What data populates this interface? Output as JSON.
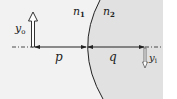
{
  "diagram": {
    "labels": {
      "n1": "n",
      "n1_sub": "1",
      "n2": "n",
      "n2_sub": "2",
      "object_height": "y",
      "object_height_sub": "o",
      "image_height": "y",
      "image_height_sub": "i",
      "object_distance": "p",
      "image_distance": "q"
    },
    "colors": {
      "medium1": "#f2f2f2",
      "medium2": "#e1e1e1",
      "line": "#222222"
    }
  }
}
